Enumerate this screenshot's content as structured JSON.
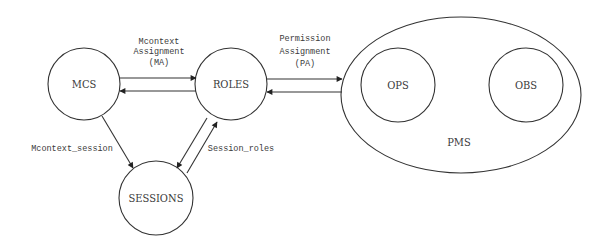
{
  "diagram": {
    "nodes": {
      "mcs": {
        "label": "MCS"
      },
      "roles": {
        "label": "ROLES"
      },
      "sessions": {
        "label": "SESSIONS"
      },
      "pms": {
        "label": "PMS"
      },
      "ops": {
        "label": "OPS"
      },
      "obs": {
        "label": "OBS"
      }
    },
    "edges": {
      "ma": {
        "line1": "Mcontext",
        "line2": "Assignment",
        "line3": "(MA)"
      },
      "pa": {
        "line1": "Permission",
        "line2": "Assignment",
        "line3": "(PA)"
      },
      "mcontext_session": {
        "label": "Mcontext_session"
      },
      "session_roles": {
        "label": "Session_roles"
      }
    }
  }
}
